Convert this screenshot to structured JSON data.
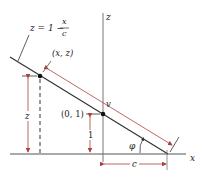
{
  "diagram": {
    "equation": {
      "lhs": "z = 1 −",
      "numerator": "x",
      "denominator": "c"
    },
    "labels": {
      "point_xz": "(x, z)",
      "point_01": "(0, 1)",
      "z_axis": "z",
      "x_axis": "x",
      "dim_z": "z",
      "dim_one": "1",
      "dim_v": "v",
      "dim_c": "c",
      "angle": "φ"
    },
    "colors": {
      "line": "#333333",
      "dimension": "#b04040",
      "axis": "#555555"
    }
  }
}
